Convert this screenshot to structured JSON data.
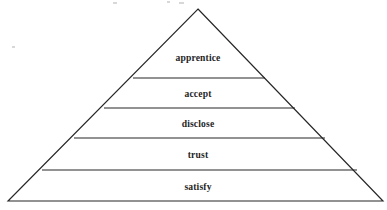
{
  "figure": {
    "type": "pyramid-diagram",
    "title": "",
    "orientation": "apex-up",
    "tier_count": 5,
    "background_color": "#ffffff",
    "stroke_color": "#262626",
    "text_color": "#1f1f1f"
  },
  "pyramid": {
    "apex": {
      "x": 198,
      "y": 9
    },
    "base_left": {
      "x": 8,
      "y": 201
    },
    "base_right": {
      "x": 383,
      "y": 201
    },
    "dividers": [
      {
        "y": 78,
        "x1": 133,
        "x2": 265
      },
      {
        "y": 108,
        "x1": 104,
        "x2": 295
      },
      {
        "y": 138,
        "x1": 74,
        "x2": 325
      },
      {
        "y": 170,
        "x1": 42,
        "x2": 357
      }
    ]
  },
  "tiers": [
    {
      "index": 1,
      "position": "top",
      "label": "apprentice",
      "label_x": 198,
      "label_y": 61,
      "band_top_y": 9,
      "band_bottom_y": 78
    },
    {
      "index": 2,
      "position": "upper-middle",
      "label": "accept",
      "label_x": 198,
      "label_y": 97,
      "band_top_y": 78,
      "band_bottom_y": 108
    },
    {
      "index": 3,
      "position": "middle",
      "label": "disclose",
      "label_x": 198,
      "label_y": 127,
      "band_top_y": 108,
      "band_bottom_y": 138
    },
    {
      "index": 4,
      "position": "lower-middle",
      "label": "trust",
      "label_x": 198,
      "label_y": 158,
      "band_top_y": 138,
      "band_bottom_y": 170
    },
    {
      "index": 5,
      "position": "base",
      "label": "satisfy",
      "label_x": 198,
      "label_y": 190,
      "band_top_y": 170,
      "band_bottom_y": 201
    }
  ]
}
